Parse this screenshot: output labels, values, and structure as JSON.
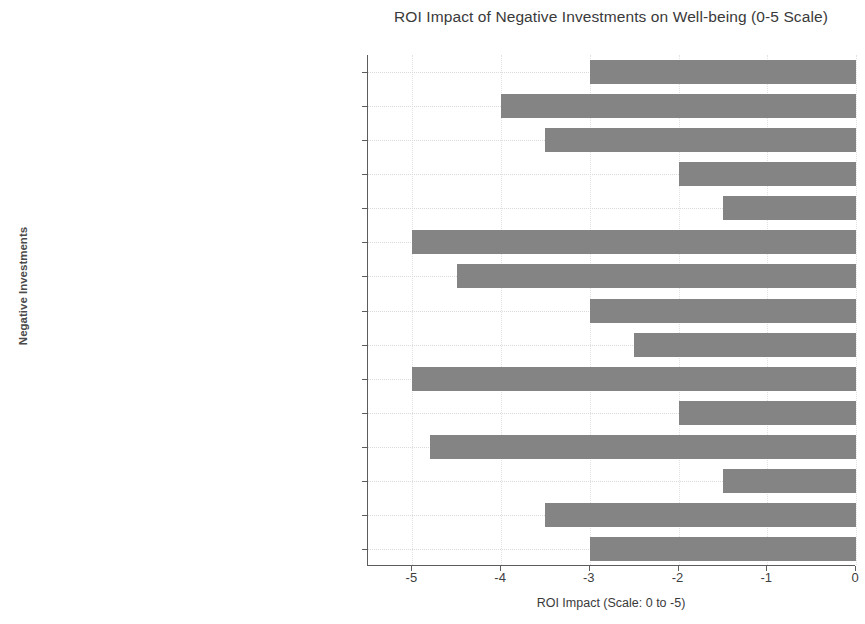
{
  "chart_data": {
    "type": "bar",
    "orientation": "horizontal",
    "title": "ROI Impact of Negative Investments on Well-being (0-5 Scale)",
    "xlabel": "ROI Impact (Scale: 0 to -5)",
    "ylabel": "Negative Investments",
    "xlim": [
      -5.5,
      0
    ],
    "xticks": [
      -5,
      -4,
      -3,
      -2,
      -1,
      0
    ],
    "xtick_labels": [
      "-5",
      "-4",
      "-3",
      "-2",
      "-1",
      "0"
    ],
    "grid": true,
    "legend": "none",
    "bar_color": "#848484",
    "categories": [
      "Poor diet (high fat, sugar, salt, low nutrients)",
      "Lack of daily physical activity",
      "Poor sleep (less than 7-9 hours)",
      "Feeling unsafe at work, online, or home",
      "Exposure to harmful media content",
      "Smoking or self-harm behaviors",
      "Addictive behaviors (excessive media, shopping, gambling, etc.)",
      "Negative behaviors (dishonesty, impulsivity, destructive actions)",
      "Alcohol consumption (unhealthy levels)",
      "Struggling with mental health & chronic illness",
      "Excessive caffeine/energy drinks",
      "Misusing prescription or recreational drugs",
      "Choosing not to believe in God",
      "Struggling with meaning, hope, and purpose",
      "Holding onto resentment, struggling with forgiveness"
    ],
    "values": [
      -3.0,
      -4.0,
      -3.5,
      -2.0,
      -1.5,
      -5.0,
      -4.5,
      -3.0,
      -2.5,
      -5.0,
      -2.0,
      -4.8,
      -1.5,
      -3.5,
      -3.0
    ]
  }
}
